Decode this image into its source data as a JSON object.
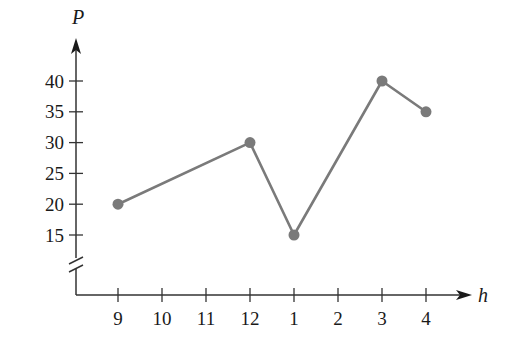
{
  "chart_data": {
    "type": "line",
    "title": "",
    "xlabel": "h",
    "ylabel": "P",
    "categories": [
      "9",
      "10",
      "11",
      "12",
      "1",
      "2",
      "3",
      "4"
    ],
    "x_ticks": [
      "9",
      "10",
      "11",
      "12",
      "1",
      "2",
      "3",
      "4"
    ],
    "y_ticks": [
      15,
      20,
      25,
      30,
      35,
      40
    ],
    "ylim": [
      15,
      40
    ],
    "y_axis_break": true,
    "grid": false,
    "legend": null,
    "series": [
      {
        "name": "P",
        "color": "#7a7a7a",
        "points": [
          {
            "x": "9",
            "y": 20
          },
          {
            "x": "12",
            "y": 30
          },
          {
            "x": "1",
            "y": 15
          },
          {
            "x": "3",
            "y": 40
          },
          {
            "x": "4",
            "y": 35
          }
        ]
      }
    ]
  },
  "style": {
    "axis_color": "#333333",
    "line_color": "#7a7a7a",
    "marker_color": "#7a7a7a"
  }
}
